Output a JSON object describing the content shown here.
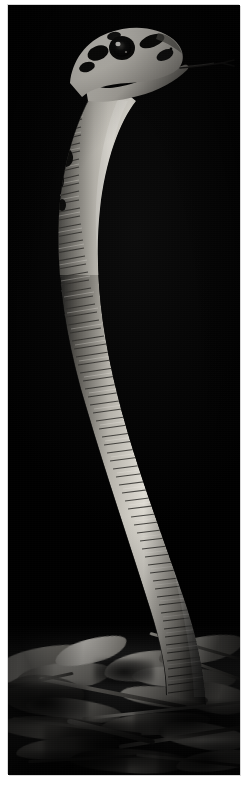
{
  "page": {
    "background_color": "#ffffff",
    "width": 252,
    "height": 788
  },
  "photo": {
    "alt_text": "Snake rearing upright against a black background",
    "subject": "snake",
    "orientation": "portrait",
    "color_mode": "black-and-white",
    "frame": {
      "left": 8,
      "top": 5,
      "width": 232,
      "height": 770,
      "border_color": "#d8d8d8",
      "background_color": "#000000"
    },
    "palette": {
      "background": "#000000",
      "body_light": "#d9d6d0",
      "body_mid": "#9a968f",
      "body_shadow": "#2b2a28",
      "marking_dark": "#0a0a0a",
      "eye_dark": "#050505",
      "eye_highlight": "#f2f0ec",
      "ground_light": "#cfccc5",
      "ground_mid": "#7d7a74",
      "ground_dark": "#151515"
    },
    "elements": {
      "head_label": "snake head with open mouth",
      "eye_label": "eye",
      "tongue_label": "forked tongue",
      "mouth_label": "open mouth",
      "neck_label": "raised neck",
      "body_label": "coiled body with ventral scales",
      "ground_label": "dry leaf litter and twigs"
    },
    "scales": {
      "ventral_band_count": 96,
      "lateral_speckle_count": 58
    },
    "ground_litter": {
      "leaf_count": 16,
      "twig_count": 11
    }
  }
}
